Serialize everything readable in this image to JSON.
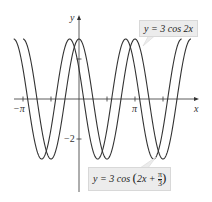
{
  "chart_data": {
    "type": "line",
    "title": "",
    "xlabel": "x",
    "ylabel": "y",
    "x_ticks": [
      {
        "value": -3.14159,
        "label": "−π"
      },
      {
        "value": 3.14159,
        "label": "π"
      }
    ],
    "x_minor_ticks": [
      -1.5708,
      1.5708,
      4.7124
    ],
    "y_ticks": [
      {
        "value": -2,
        "label": "−2"
      }
    ],
    "y_minor_ticks": [
      2
    ],
    "xlim": [
      -3.6,
      5.6
    ],
    "ylim": [
      -4.2,
      4.2
    ],
    "grid": false,
    "series": [
      {
        "name": "y = 3 cos 2x",
        "function": "3*cos(2*x)",
        "x_range": [
          -3.14159,
          6.28318
        ],
        "color": "#333333"
      },
      {
        "name": "y = 3 cos (2x + π/3)",
        "function": "3*cos(2*x + pi/3)",
        "x_range": [
          -3.6652,
          5.7596
        ],
        "color": "#333333"
      }
    ],
    "annotations": [
      {
        "text": "y = 3 cos 2x",
        "position": "top-right"
      },
      {
        "text": "y = 3 cos (2x + π/3)",
        "position": "bottom-center"
      }
    ]
  },
  "labels": {
    "x_axis": "x",
    "y_axis": "y",
    "neg_pi": "−π",
    "pi": "π",
    "neg_two": "−2",
    "callout1": "y = 3 cos 2x",
    "callout2_prefix": "y = 3 cos ",
    "callout2_inner": "2x + ",
    "callout2_num": "π",
    "callout2_den": "3"
  }
}
